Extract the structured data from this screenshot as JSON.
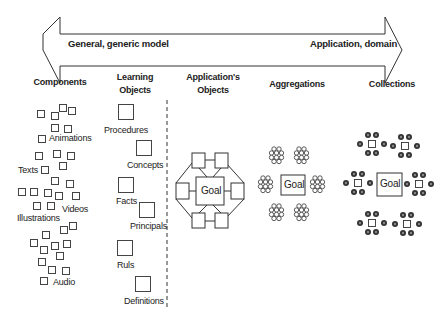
{
  "arrow": {
    "left_label": "General, generic model",
    "right_label": "Application, domain"
  },
  "columns": {
    "components": {
      "title": "Components",
      "labels": [
        "Animations",
        "Texts",
        "Videos",
        "Illustrations",
        "Audio"
      ]
    },
    "learning_objects": {
      "title_line1": "Learning",
      "title_line2": "Objects",
      "items": [
        "Procedures",
        "Concepts",
        "Facts",
        "Principals",
        "Ruls",
        "Definitions"
      ]
    },
    "applications_objects": {
      "title_line1": "Application's",
      "title_line2": "Objects",
      "center_label": "Goal"
    },
    "aggregations": {
      "title": "Aggregations",
      "center_label": "Goal"
    },
    "collections": {
      "title": "Collections",
      "center_label": "Goal"
    }
  }
}
